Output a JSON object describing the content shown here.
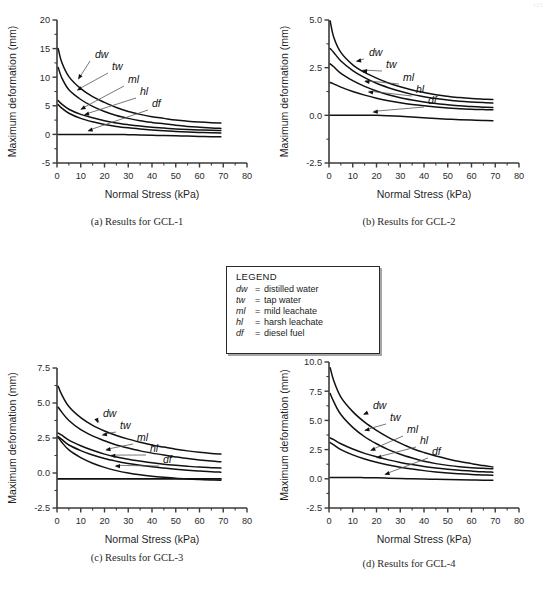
{
  "page": {
    "corner_mark": "121"
  },
  "legend": {
    "title": "LEGEND",
    "rows": [
      {
        "symbol": "dw",
        "eq": "=",
        "text": "distilled water"
      },
      {
        "symbol": "tw",
        "eq": "=",
        "text": "tap water"
      },
      {
        "symbol": "ml",
        "eq": "=",
        "text": "mild leachate"
      },
      {
        "symbol": "hl",
        "eq": "=",
        "text": "harsh leachate"
      },
      {
        "symbol": "df",
        "eq": "=",
        "text": "diesel fuel"
      }
    ]
  },
  "captions": {
    "a": "(a)  Results for GCL-1",
    "b": "(b)  Results for GCL-2",
    "c": "(c)  Results for GCL-3",
    "d": "(d)  Results for GCL-4"
  },
  "axis": {
    "xlabel": "Normal Stress  (kPa)",
    "ylabel": "Maximum deformation (mm)",
    "xticks": [
      "0",
      "10",
      "20",
      "30",
      "40",
      "50",
      "60",
      "70",
      "80"
    ],
    "xvalues": [
      0,
      10,
      20,
      30,
      40,
      50,
      60,
      70,
      80
    ]
  },
  "curve_labels": [
    "dw",
    "tw",
    "ml",
    "hl",
    "df"
  ],
  "chart_data": [
    {
      "id": "a",
      "type": "line",
      "title": "(a)  Results for GCL-1",
      "xlabel": "Normal Stress  (kPa)",
      "ylabel": "Maximum deformation (mm)",
      "xlim": [
        0,
        80
      ],
      "ylim": [
        -5,
        20
      ],
      "xticks": [
        0,
        10,
        20,
        30,
        40,
        50,
        60,
        70,
        80
      ],
      "yticks": [
        -5,
        0,
        5,
        10,
        15,
        20
      ],
      "ytick_labels": [
        "-5",
        "0",
        "5",
        "10",
        "15",
        "20"
      ],
      "grid": false,
      "legend": "external-box",
      "x": [
        0.5,
        2,
        5,
        10,
        15,
        20,
        25,
        30,
        35,
        40,
        45,
        50,
        55,
        60,
        65,
        69
      ],
      "series": [
        {
          "name": "dw",
          "label": "distilled water",
          "values": [
            15.0,
            12.6,
            10.1,
            8.0,
            6.6,
            5.6,
            4.7,
            4.0,
            3.5,
            3.1,
            2.8,
            2.5,
            2.3,
            2.15,
            2.05,
            2.0
          ]
        },
        {
          "name": "tw",
          "label": "tap water",
          "values": [
            11.7,
            9.9,
            7.8,
            6.1,
            4.9,
            4.0,
            3.3,
            2.8,
            2.4,
            2.1,
            1.85,
            1.6,
            1.4,
            1.25,
            1.12,
            1.05
          ]
        },
        {
          "name": "ml",
          "label": "mild leachate",
          "values": [
            5.9,
            5.3,
            4.4,
            3.5,
            2.9,
            2.4,
            2.0,
            1.7,
            1.45,
            1.25,
            1.1,
            0.95,
            0.85,
            0.78,
            0.72,
            0.7
          ]
        },
        {
          "name": "hl",
          "label": "harsh leachate",
          "values": [
            5.2,
            4.6,
            3.7,
            2.8,
            2.2,
            1.75,
            1.4,
            1.15,
            0.95,
            0.78,
            0.65,
            0.52,
            0.42,
            0.34,
            0.28,
            0.25
          ]
        },
        {
          "name": "df",
          "label": "diesel fuel",
          "values": [
            0.0,
            0.0,
            0.0,
            0.0,
            0.0,
            0.0,
            0.0,
            -0.05,
            -0.1,
            -0.15,
            -0.2,
            -0.25,
            -0.3,
            -0.35,
            -0.4,
            -0.42
          ]
        }
      ]
    },
    {
      "id": "b",
      "type": "line",
      "title": "(b)  Results for GCL-2",
      "xlabel": "Normal Stress  (kPa)",
      "ylabel": "Maximum deformation (mm)",
      "xlim": [
        0,
        80
      ],
      "ylim": [
        -2.5,
        5.0
      ],
      "xticks": [
        0,
        10,
        20,
        30,
        40,
        50,
        60,
        70,
        80
      ],
      "yticks": [
        -2.5,
        0.0,
        2.5,
        5.0
      ],
      "ytick_labels": [
        "-2.5",
        "0.0",
        "2.5",
        "5.0"
      ],
      "grid": false,
      "legend": "external-box",
      "x": [
        0.5,
        2,
        5,
        10,
        15,
        20,
        25,
        30,
        35,
        40,
        45,
        50,
        55,
        60,
        65,
        69
      ],
      "series": [
        {
          "name": "dw",
          "label": "distilled water",
          "values": [
            4.95,
            4.1,
            3.3,
            2.65,
            2.25,
            1.95,
            1.7,
            1.5,
            1.33,
            1.2,
            1.08,
            1.0,
            0.93,
            0.88,
            0.85,
            0.83
          ]
        },
        {
          "name": "tw",
          "label": "tap water",
          "values": [
            3.5,
            3.3,
            2.85,
            2.35,
            1.98,
            1.68,
            1.45,
            1.26,
            1.1,
            0.98,
            0.88,
            0.8,
            0.74,
            0.7,
            0.67,
            0.65
          ]
        },
        {
          "name": "ml",
          "label": "mild leachate",
          "values": [
            2.7,
            2.55,
            2.2,
            1.82,
            1.52,
            1.28,
            1.08,
            0.92,
            0.8,
            0.7,
            0.62,
            0.55,
            0.5,
            0.46,
            0.43,
            0.41
          ]
        },
        {
          "name": "hl",
          "label": "harsh leachate",
          "values": [
            1.72,
            1.65,
            1.48,
            1.25,
            1.06,
            0.9,
            0.77,
            0.66,
            0.57,
            0.5,
            0.44,
            0.39,
            0.35,
            0.32,
            0.3,
            0.29
          ]
        },
        {
          "name": "df",
          "label": "diesel fuel",
          "values": [
            0.0,
            0.0,
            0.0,
            0.0,
            0.0,
            0.0,
            -0.02,
            -0.05,
            -0.09,
            -0.13,
            -0.17,
            -0.2,
            -0.23,
            -0.25,
            -0.27,
            -0.28
          ]
        }
      ]
    },
    {
      "id": "c",
      "type": "line",
      "title": "(c)  Results for GCL-3",
      "xlabel": "Normal Stress  (kPa)",
      "ylabel": "Maximum deformation (mm)",
      "xlim": [
        0,
        80
      ],
      "ylim": [
        -2.5,
        7.5
      ],
      "xticks": [
        0,
        10,
        20,
        30,
        40,
        50,
        60,
        70,
        80
      ],
      "yticks": [
        -2.5,
        0.0,
        2.5,
        5.0,
        7.5
      ],
      "ytick_labels": [
        "-2.5",
        "0.0",
        "2.5",
        "5.0",
        "7.5"
      ],
      "grid": false,
      "legend": "external-box",
      "x": [
        0.5,
        2,
        5,
        10,
        15,
        20,
        25,
        30,
        35,
        40,
        45,
        50,
        55,
        60,
        65,
        69
      ],
      "series": [
        {
          "name": "dw",
          "label": "distilled water",
          "values": [
            6.2,
            5.6,
            4.75,
            3.95,
            3.4,
            3.0,
            2.68,
            2.42,
            2.2,
            2.0,
            1.85,
            1.7,
            1.58,
            1.48,
            1.4,
            1.35
          ]
        },
        {
          "name": "tw",
          "label": "tap water",
          "values": [
            4.7,
            4.35,
            3.75,
            3.1,
            2.65,
            2.3,
            2.0,
            1.78,
            1.58,
            1.42,
            1.28,
            1.15,
            1.03,
            0.93,
            0.85,
            0.8
          ]
        },
        {
          "name": "ml",
          "label": "mild leachate",
          "values": [
            2.85,
            2.7,
            2.35,
            1.95,
            1.62,
            1.35,
            1.15,
            0.98,
            0.85,
            0.73,
            0.63,
            0.55,
            0.48,
            0.42,
            0.38,
            0.35
          ]
        },
        {
          "name": "hl",
          "label": "harsh leachate",
          "values": [
            2.6,
            2.4,
            2.0,
            1.6,
            1.28,
            1.03,
            0.84,
            0.68,
            0.55,
            0.44,
            0.35,
            0.27,
            0.2,
            0.14,
            0.09,
            0.06
          ]
        },
        {
          "name": "df",
          "label": "diesel fuel",
          "values": [
            2.55,
            2.2,
            1.65,
            1.1,
            0.7,
            0.4,
            0.17,
            0.0,
            -0.13,
            -0.23,
            -0.31,
            -0.38,
            -0.43,
            -0.47,
            -0.5,
            -0.52
          ]
        },
        {
          "name": "baseline",
          "label": "zero reference",
          "values": [
            -0.42,
            -0.42,
            -0.42,
            -0.42,
            -0.42,
            -0.42,
            -0.42,
            -0.42,
            -0.42,
            -0.42,
            -0.42,
            -0.42,
            -0.42,
            -0.42,
            -0.42,
            -0.42
          ]
        }
      ]
    },
    {
      "id": "d",
      "type": "line",
      "title": "(d)  Results for GCL-4",
      "xlabel": "Normal Stress  (kPa)",
      "ylabel": "Maximum deformation (mm)",
      "xlim": [
        0,
        80
      ],
      "ylim": [
        -2.5,
        10.0
      ],
      "xticks": [
        0,
        10,
        20,
        30,
        40,
        50,
        60,
        70,
        80
      ],
      "yticks": [
        -2.5,
        0.0,
        2.5,
        5.0,
        7.5,
        10.0
      ],
      "ytick_labels": [
        "-2.5",
        "0.0",
        "2.5",
        "5.0",
        "7.5",
        "10.0"
      ],
      "grid": false,
      "legend": "external-box",
      "x": [
        0.5,
        2,
        5,
        10,
        15,
        20,
        25,
        30,
        35,
        40,
        45,
        50,
        55,
        60,
        65,
        69
      ],
      "series": [
        {
          "name": "dw",
          "label": "distilled water",
          "values": [
            9.5,
            8.4,
            7.0,
            5.75,
            4.85,
            4.15,
            3.55,
            3.05,
            2.6,
            2.25,
            1.95,
            1.7,
            1.48,
            1.3,
            1.13,
            1.02
          ]
        },
        {
          "name": "tw",
          "label": "tap water",
          "values": [
            7.3,
            6.6,
            5.5,
            4.4,
            3.6,
            3.0,
            2.5,
            2.1,
            1.78,
            1.5,
            1.3,
            1.15,
            1.03,
            0.95,
            0.9,
            0.87
          ]
        },
        {
          "name": "ml",
          "label": "mild leachate",
          "values": [
            3.5,
            3.35,
            3.0,
            2.55,
            2.18,
            1.88,
            1.62,
            1.4,
            1.22,
            1.06,
            0.93,
            0.82,
            0.73,
            0.66,
            0.6,
            0.57
          ]
        },
        {
          "name": "hl",
          "label": "harsh leachate",
          "values": [
            3.1,
            2.9,
            2.5,
            2.05,
            1.7,
            1.42,
            1.18,
            0.99,
            0.83,
            0.7,
            0.59,
            0.5,
            0.43,
            0.37,
            0.33,
            0.3
          ]
        },
        {
          "name": "df",
          "label": "diesel fuel",
          "values": [
            0.12,
            0.12,
            0.12,
            0.12,
            0.1,
            0.08,
            0.05,
            0.02,
            0.0,
            -0.02,
            -0.04,
            -0.06,
            -0.08,
            -0.1,
            -0.12,
            -0.13
          ]
        }
      ]
    }
  ]
}
